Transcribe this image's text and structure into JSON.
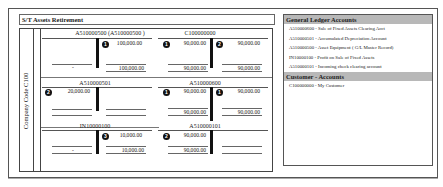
{
  "title": "S/T Assets Retirement",
  "side_label": "Company Code C100",
  "t_accounts": [
    {
      "id": "A510000500",
      "title": "A510000500 (A510000500 )",
      "debit": [],
      "credit": [
        {
          "badge": "1",
          "amount": "100,000.00"
        }
      ],
      "debit_total": "-",
      "credit_total": "100,000.00"
    },
    {
      "id": "C100000000",
      "title": "C100000000",
      "debit": [
        {
          "badge": "1",
          "amount": "90,000.00"
        }
      ],
      "credit": [
        {
          "badge": "2",
          "amount": "90,000.00"
        }
      ],
      "debit_total": "90,000.00",
      "credit_total": "90,000.00"
    },
    {
      "id": "A510000501",
      "title": "A510000501",
      "debit": [
        {
          "badge": "2",
          "amount": "20,000.00"
        }
      ],
      "credit": [],
      "debit_total": "",
      "credit_total": ""
    },
    {
      "id": "A510000600",
      "title": "A510000600",
      "debit": [
        {
          "badge": "1",
          "amount": "90,000.00"
        }
      ],
      "credit": [
        {
          "badge": "1",
          "amount": "90,000.00"
        }
      ],
      "debit_total": "90,000.00",
      "credit_total": "90,000.00"
    },
    {
      "id": "IN10000100",
      "title": "IN10000100",
      "debit": [],
      "credit": [
        {
          "badge": "3",
          "amount": "10,000.00"
        }
      ],
      "debit_total": "-",
      "credit_total": "10,000.00"
    },
    {
      "id": "A510000101",
      "title": "A510000101",
      "debit": [
        {
          "badge": "2",
          "amount": "90,000.00"
        }
      ],
      "credit": [],
      "debit_total": "90,000.00",
      "credit_total": ""
    }
  ],
  "legend": {
    "gl_header": "General Ledger Accounts",
    "gl_items": [
      "A510000600 - Sale of Fixed Assets Clearing Acct",
      "A510000501 - Accumulated Depreciation Account",
      "A510000500 - Asset Equipment ( G/L Master Record)",
      "IN10000100 - Profit on Sale of Fixed Assets",
      "A510000101 - Incoming check clearing account"
    ],
    "customer_header": "Customer - Accounts",
    "customer_items": [
      "C100000000 - My Customer"
    ]
  }
}
